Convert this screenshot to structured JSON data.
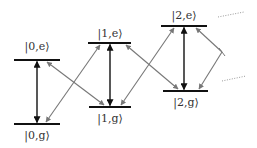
{
  "diagram": {
    "levels": [
      {
        "id": "0e",
        "label": "|0,e⟩",
        "x1": 14,
        "x2": 60,
        "y": 60,
        "label_x": 37,
        "label_y": 50
      },
      {
        "id": "0g",
        "label": "|0,g⟩",
        "x1": 14,
        "x2": 60,
        "y": 124,
        "label_x": 37,
        "label_y": 139
      },
      {
        "id": "1e",
        "label": "|1,e⟩",
        "x1": 88,
        "x2": 131,
        "y": 43,
        "label_x": 110,
        "label_y": 37
      },
      {
        "id": "1g",
        "label": "|1,g⟩",
        "x1": 89,
        "x2": 131,
        "y": 107,
        "label_x": 110,
        "label_y": 122
      },
      {
        "id": "2e",
        "label": "|2,e⟩",
        "x1": 161,
        "x2": 207,
        "y": 26,
        "label_x": 184,
        "label_y": 19
      },
      {
        "id": "2g",
        "label": "|2,g⟩",
        "x1": 163,
        "x2": 208,
        "y": 91,
        "label_x": 186,
        "label_y": 106
      }
    ],
    "transitions": [
      {
        "from": "0e",
        "to": "0g",
        "type": "vertical",
        "color": "#111111"
      },
      {
        "from": "1e",
        "to": "1g",
        "type": "vertical",
        "color": "#111111"
      },
      {
        "from": "2e",
        "to": "2g",
        "type": "vertical",
        "color": "#111111"
      },
      {
        "from": "0e",
        "to": "1g",
        "type": "diagonal",
        "color": "#777777"
      },
      {
        "from": "0g",
        "to": "1e",
        "type": "diagonal",
        "color": "#777777"
      },
      {
        "from": "1e",
        "to": "2g",
        "type": "diagonal",
        "color": "#777777"
      },
      {
        "from": "1g",
        "to": "2e",
        "type": "diagonal",
        "color": "#777777"
      },
      {
        "from": "2e",
        "to": "crossing",
        "type": "diagonal",
        "color": "#777777"
      },
      {
        "from": "crossing",
        "to": "2g",
        "type": "diagonal",
        "color": "#777777"
      }
    ],
    "continuation": "dotted lines indicating higher levels",
    "colors": {
      "level_line": "#111111",
      "vertical_arrow": "#111111",
      "diagonal_arrow": "#777777",
      "dots": "#999999",
      "label": "#333333"
    }
  }
}
